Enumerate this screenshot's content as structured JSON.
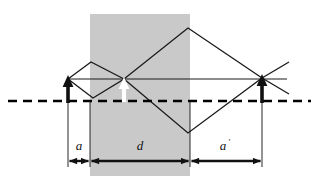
{
  "figure": {
    "type": "optics-ray-diagram",
    "title": "",
    "width": 319,
    "height": 191,
    "background_color": "#ffffff"
  },
  "colors": {
    "ink": "#111111",
    "ray": "#1a1a1a",
    "slab_fill": "#c9c9c9",
    "white_arrow": "#ffffff",
    "axis": "#000000"
  },
  "slab": {
    "name": "glass-slab",
    "x": 90,
    "y": 14,
    "width": 100,
    "height": 162,
    "fill": "#c9c9c9"
  },
  "optical_axis": {
    "name": "optical-axis",
    "y": 101,
    "x_start": 8,
    "x_end": 311,
    "style": "dashed",
    "dash_pattern": "9 6",
    "stroke_width": 2.6
  },
  "principal_ray": {
    "name": "principal-ray",
    "y": 79,
    "x_start": 68,
    "x_end": 287,
    "stroke_width": 1.0
  },
  "objects": [
    {
      "name": "object-arrow",
      "kind": "black-arrow-up",
      "x": 68,
      "y_base": 101,
      "y_tip": 78,
      "color": "#111111"
    },
    {
      "name": "intermediate-image-arrow",
      "kind": "white-arrow-up",
      "x": 124,
      "y_base": 101,
      "y_tip": 79,
      "color": "#ffffff"
    },
    {
      "name": "final-image-arrow",
      "kind": "black-arrow-up",
      "x": 262,
      "y_base": 101,
      "y_tip": 77,
      "color": "#111111"
    }
  ],
  "ray_bundles": [
    {
      "name": "left-ray-diamond",
      "vertices": [
        [
          68,
          79
        ],
        [
          91,
          62
        ],
        [
          124,
          79
        ],
        [
          93,
          98
        ]
      ]
    },
    {
      "name": "right-ray-diamond",
      "vertices": [
        [
          124,
          79
        ],
        [
          188,
          28
        ],
        [
          262,
          78
        ],
        [
          188,
          133
        ]
      ]
    }
  ],
  "extension_rays": [
    {
      "name": "upper-right-extension-ray",
      "x1": 262,
      "y1": 78,
      "x2": 288,
      "y2": 63
    },
    {
      "name": "lower-right-extension-ray",
      "x1": 262,
      "y1": 78,
      "x2": 288,
      "y2": 93
    }
  ],
  "dimensions": {
    "tick_lines": [
      {
        "name": "dim-tick-object",
        "x": 68,
        "y1": 101,
        "y2": 167
      },
      {
        "name": "dim-tick-slab-left",
        "x": 90,
        "y1": 101,
        "y2": 167
      },
      {
        "name": "dim-tick-slab-right",
        "x": 190,
        "y1": 101,
        "y2": 167
      },
      {
        "name": "dim-tick-image",
        "x": 262,
        "y1": 101,
        "y2": 167
      }
    ],
    "measures": [
      {
        "name": "dimension-a",
        "label": "a",
        "prime": "",
        "x_start": 68,
        "x_end": 90,
        "y": 161,
        "label_x": 79,
        "label_y": 150
      },
      {
        "name": "dimension-d",
        "label": "d",
        "prime": "",
        "x_start": 90,
        "x_end": 190,
        "y": 161,
        "label_x": 140,
        "label_y": 150
      },
      {
        "name": "dimension-a-prime",
        "label": "a",
        "prime": "'",
        "x_start": 190,
        "x_end": 262,
        "y": 161,
        "label_x": 224,
        "label_y": 150
      }
    ]
  }
}
